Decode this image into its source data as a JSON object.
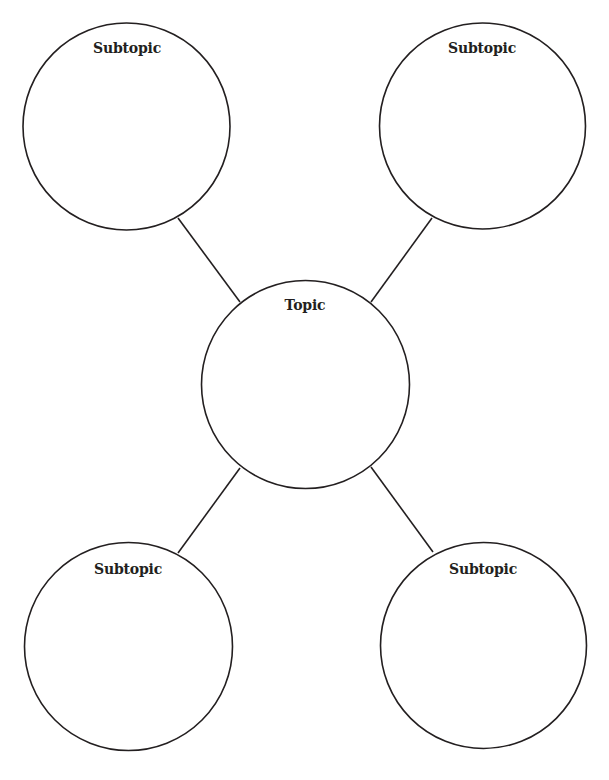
{
  "diagram": {
    "type": "web-organizer",
    "stroke_color": "#231f20",
    "background": "#ffffff",
    "center": {
      "label": "Topic"
    },
    "subtopics": [
      {
        "label": "Subtopic",
        "position": "top-left"
      },
      {
        "label": "Subtopic",
        "position": "top-right"
      },
      {
        "label": "Subtopic",
        "position": "bottom-left"
      },
      {
        "label": "Subtopic",
        "position": "bottom-right"
      }
    ]
  }
}
